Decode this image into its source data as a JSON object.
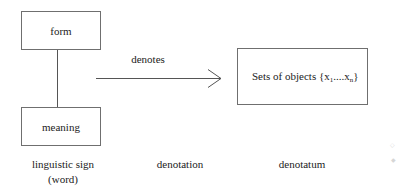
{
  "diagram": {
    "type": "concept-diagram",
    "nodes": {
      "form": {
        "label": "form"
      },
      "meaning": {
        "label": "meaning"
      },
      "denotatum_box": {
        "label_prefix": "Sets of objects {x",
        "sub1": "1",
        "middle": "....x",
        "subn": "n",
        "label_suffix": "}",
        "full_text": "Sets of objects {x1....xn}"
      }
    },
    "edges": [
      {
        "from": "form",
        "to": "meaning",
        "kind": "line",
        "label": ""
      },
      {
        "from": "linguistic_sign",
        "to": "denotatum_box",
        "kind": "arrow",
        "label": "denotes"
      }
    ],
    "arrow_label": "denotes",
    "captions": {
      "sign_line1": "linguistic sign",
      "sign_line2": "(word)",
      "denotation": "denotation",
      "denotatum": "denotatum"
    },
    "colors": {
      "stroke": "#6f6f6f",
      "text": "#222222",
      "background": "#ffffff"
    }
  }
}
